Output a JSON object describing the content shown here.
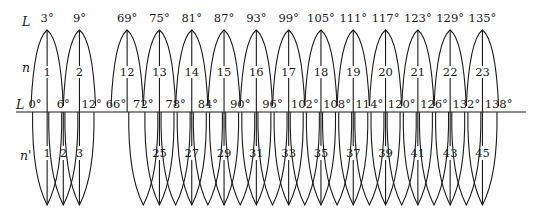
{
  "diagram": {
    "row_labels": {
      "upper_L": "L",
      "upper_n": "n",
      "axis_L": "L",
      "lower_n": "n'"
    },
    "upper_zones": [
      {
        "n": "1",
        "center": "3°"
      },
      {
        "n": "2",
        "center": "9°"
      },
      {
        "n": "12",
        "center": "69°"
      },
      {
        "n": "13",
        "center": "75°"
      },
      {
        "n": "14",
        "center": "81°"
      },
      {
        "n": "15",
        "center": "87°"
      },
      {
        "n": "16",
        "center": "93°"
      },
      {
        "n": "17",
        "center": "99°"
      },
      {
        "n": "18",
        "center": "105°"
      },
      {
        "n": "19",
        "center": "111°"
      },
      {
        "n": "20",
        "center": "117°"
      },
      {
        "n": "21",
        "center": "123°"
      },
      {
        "n": "22",
        "center": "129°"
      },
      {
        "n": "23",
        "center": "135°"
      }
    ],
    "axis_ticks": [
      "0°",
      "6°",
      "12°",
      "66°",
      "72°",
      "78°",
      "84°",
      "90°",
      "96°",
      "102°",
      "108°",
      "114°",
      "120°",
      "126°",
      "132°",
      "138°"
    ],
    "lower_zone_labels": [
      "1",
      "2",
      "3",
      "25",
      "27",
      "29",
      "31",
      "33",
      "35",
      "37",
      "39",
      "41",
      "43",
      "45"
    ]
  }
}
